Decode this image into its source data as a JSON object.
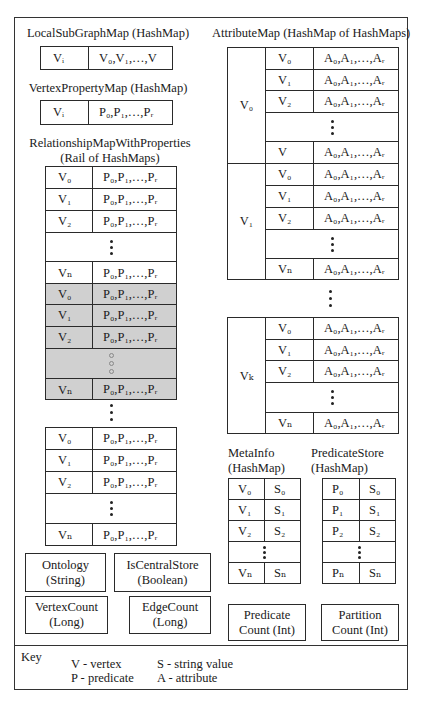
{
  "local_subgraph_map": {
    "title": "LocalSubGraphMap (HashMap)",
    "key": "Vᵢ",
    "value": "V₀,V₁,…,V"
  },
  "vertex_property_map": {
    "title": "VertexPropertyMap (HashMap)",
    "key": "Vᵢ",
    "value": "P₀,P₁,…,Pᵣ"
  },
  "relationship_map": {
    "title_line1": "RelationshipMapWithProperties",
    "title_line2": "(Rail of HashMaps)",
    "blocks": [
      {
        "shaded": false,
        "rows": [
          {
            "key": "V₀",
            "value": "P₀,P₁,…,Pᵣ"
          },
          {
            "key": "V₁",
            "value": "P₀,P₁,…,Pᵣ"
          },
          {
            "key": "V₂",
            "value": "P₀,P₁,…,Pᵣ"
          },
          {
            "key": "Vₙ",
            "value": "P₀,P₁,…,Pᵣ"
          }
        ]
      },
      {
        "shaded": true,
        "rows": [
          {
            "key": "V₀",
            "value": "P₀,P₁,…,Pᵣ"
          },
          {
            "key": "V₁",
            "value": "P₀,P₁,…,Pᵣ"
          },
          {
            "key": "V₂",
            "value": "P₀,P₁,…,Pᵣ"
          },
          {
            "key": "Vₙ",
            "value": "P₀,P₁,…,Pᵣ"
          }
        ]
      },
      {
        "shaded": false,
        "rows": [
          {
            "key": "V₀",
            "value": "P₀,P₁,…,Pᵣ"
          },
          {
            "key": "V₁",
            "value": "P₀,P₁,…,Pᵣ"
          },
          {
            "key": "V₂",
            "value": "P₀,P₁,…,Pᵣ"
          },
          {
            "key": "Vₙ",
            "value": "P₀,P₁,…,Pᵣ"
          }
        ]
      }
    ]
  },
  "attribute_map": {
    "title": "AttributeMap (HashMap of HashMaps)",
    "blocks": [
      {
        "outer_key": "V₀",
        "rows": [
          {
            "key": "V₀",
            "value": "A₀,A₁,…,Aᵣ"
          },
          {
            "key": "V₁",
            "value": "A₀,A₁,…,Aᵣ"
          },
          {
            "key": "V₂",
            "value": "A₀,A₁,…,Aᵣ"
          },
          {
            "key": "V",
            "value": "A₀,A₁,…,Aᵣ"
          }
        ]
      },
      {
        "outer_key": "V₁",
        "rows": [
          {
            "key": "V₀",
            "value": "A₀,A₁,…,Aᵣ"
          },
          {
            "key": "V₁",
            "value": "A₀,A₁,…,Aᵣ"
          },
          {
            "key": "V₂",
            "value": "A₀,A₁,…,Aᵣ"
          },
          {
            "key": "Vₙ",
            "value": "A₀,A₁,…,Aᵣ"
          }
        ]
      },
      {
        "outer_key": "Vₖ",
        "rows": [
          {
            "key": "V₀",
            "value": "A₀,A₁,…,Aᵣ"
          },
          {
            "key": "V₁",
            "value": "A₀,A₁,…,Aᵣ"
          },
          {
            "key": "V₂",
            "value": "A₀,A₁,…,Aᵣ"
          },
          {
            "key": "Vₙ",
            "value": "A₀,A₁,…,Aᵣ"
          }
        ]
      }
    ]
  },
  "meta_info": {
    "title_line1": "MetaInfo",
    "title_line2": "(HashMap)",
    "rows": [
      {
        "key": "V₀",
        "value": "S₀"
      },
      {
        "key": "V₁",
        "value": "S₁"
      },
      {
        "key": "V₂",
        "value": "S₂"
      },
      {
        "key": "Vₙ",
        "value": "Sₙ"
      }
    ]
  },
  "predicate_store": {
    "title_line1": "PredicateStore",
    "title_line2": "(HashMap)",
    "rows": [
      {
        "key": "P₀",
        "value": "S₀"
      },
      {
        "key": "P₁",
        "value": "S₁"
      },
      {
        "key": "P₂",
        "value": "S₂"
      },
      {
        "key": "Pₙ",
        "value": "Sₙ"
      }
    ]
  },
  "scalars": {
    "ontology": {
      "line1": "Ontology",
      "line2": "(String)"
    },
    "is_central_store": {
      "line1": "IsCentralStore",
      "line2": "(Boolean)"
    },
    "vertex_count": {
      "line1": "VertexCount",
      "line2": "(Long)"
    },
    "edge_count": {
      "line1": "EdgeCount",
      "line2": "(Long)"
    },
    "predicate_count": {
      "line1": "Predicate",
      "line2": "Count (Int)"
    },
    "partition_count": {
      "line1": "Partition",
      "line2": "Count (Int)"
    }
  },
  "key": {
    "label": "Key",
    "entries": [
      "V - vertex",
      "P - predicate",
      "S - string value",
      "A - attribute"
    ]
  },
  "colors": {
    "border": "#2a2a2a",
    "shaded_block": "#d0d0d0",
    "background": "#ffffff"
  }
}
